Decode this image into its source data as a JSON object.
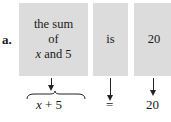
{
  "label": "a.",
  "boxes": [
    {
      "line1": "the sum",
      "line2": "of",
      "line3_var": "x",
      "line3_rest": " and 5"
    },
    {
      "text": "is"
    },
    {
      "text": "20"
    }
  ],
  "results": {
    "expr_var": "x",
    "expr_rest": " + 5",
    "equals": "=",
    "value": "20"
  }
}
